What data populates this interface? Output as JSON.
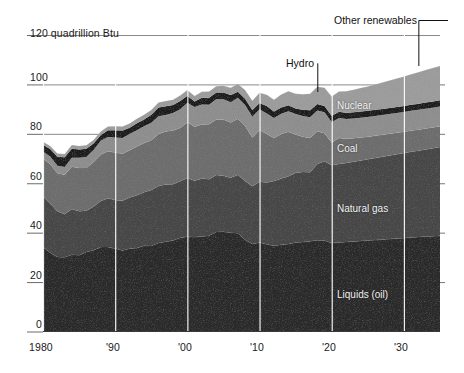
{
  "chart_data": {
    "type": "area",
    "title": "",
    "subtitle": "",
    "unit_label": "120 quadrillion Btu",
    "xlabel": "",
    "ylabel": "quadrillion Btu",
    "ylim": [
      0,
      120
    ],
    "xlim": [
      1980,
      2035
    ],
    "grid": "vertical white decade gridlines plus horizontal tick lines at 0,20,40,60,80,100,120",
    "legend_position": "inline labels on bands with leader lines for Hydro and Other renewables",
    "stacked": true,
    "y_ticks": [
      "0",
      "20",
      "40",
      "60",
      "80",
      "100",
      "120 quadrillion Btu"
    ],
    "y_tick_values": [
      0,
      20,
      40,
      60,
      80,
      100,
      120
    ],
    "x_ticks": [
      "1980",
      "'90",
      "'00",
      "'10",
      "'20",
      "'30"
    ],
    "x_tick_values": [
      1980,
      1990,
      2000,
      2010,
      2020,
      2030
    ],
    "x": [
      1980,
      1981,
      1982,
      1983,
      1984,
      1985,
      1986,
      1987,
      1988,
      1989,
      1990,
      1991,
      1992,
      1993,
      1994,
      1995,
      1996,
      1997,
      1998,
      1999,
      2000,
      2001,
      2002,
      2003,
      2004,
      2005,
      2006,
      2007,
      2008,
      2009,
      2010,
      2011,
      2012,
      2013,
      2014,
      2015,
      2016,
      2017,
      2018,
      2019,
      2020,
      2021,
      2022,
      2023,
      2024,
      2025,
      2026,
      2027,
      2028,
      2029,
      2030,
      2031,
      2032,
      2033,
      2034,
      2035
    ],
    "series": [
      {
        "name": "Liquids (oil)",
        "color": "#2b2b2b",
        "label_x": 2020,
        "values": [
          34.2,
          31.9,
          30.2,
          30.1,
          31.1,
          30.9,
          32.2,
          32.9,
          34.2,
          34.2,
          33.6,
          32.8,
          33.5,
          33.8,
          34.7,
          34.6,
          35.8,
          36.3,
          36.8,
          37.9,
          38.3,
          38.2,
          38.4,
          38.8,
          40.3,
          40.4,
          40.0,
          39.8,
          37.1,
          35.4,
          36.0,
          35.3,
          34.7,
          35.1,
          35.4,
          36.0,
          36.2,
          36.5,
          36.9,
          36.8,
          35.8,
          36.0,
          36.2,
          36.4,
          36.6,
          36.8,
          37.0,
          37.2,
          37.4,
          37.6,
          37.8,
          38.0,
          38.2,
          38.4,
          38.6,
          38.8
        ]
      },
      {
        "name": "Natural gas",
        "color": "#474747",
        "label_x": 2020,
        "values": [
          20.4,
          19.9,
          18.5,
          17.4,
          18.5,
          17.8,
          16.7,
          17.7,
          18.6,
          19.7,
          19.6,
          20.1,
          20.7,
          21.3,
          21.7,
          22.7,
          23.1,
          23.2,
          22.8,
          22.9,
          23.8,
          22.8,
          23.5,
          22.8,
          23.0,
          22.6,
          22.2,
          23.6,
          23.8,
          23.4,
          24.6,
          25.0,
          26.2,
          26.8,
          27.4,
          28.2,
          28.4,
          28.0,
          30.9,
          32.1,
          31.5,
          31.8,
          32.0,
          32.3,
          32.6,
          32.9,
          33.2,
          33.5,
          33.8,
          34.1,
          34.4,
          34.7,
          35.0,
          35.3,
          35.6,
          35.9
        ]
      },
      {
        "name": "Coal",
        "color": "#6d6d6d",
        "label_x": 2020,
        "values": [
          15.4,
          16.0,
          15.3,
          15.9,
          17.1,
          17.5,
          17.3,
          18.0,
          18.8,
          19.1,
          19.2,
          19.0,
          19.2,
          19.8,
          19.9,
          20.1,
          21.0,
          21.4,
          21.7,
          21.6,
          22.6,
          21.9,
          21.9,
          22.3,
          22.5,
          22.8,
          22.4,
          22.7,
          22.4,
          19.7,
          21.0,
          19.6,
          17.4,
          18.0,
          18.0,
          15.5,
          14.2,
          13.8,
          13.2,
          11.3,
          9.2,
          10.5,
          9.8,
          9.5,
          9.3,
          9.1,
          9.0,
          8.9,
          8.8,
          8.7,
          8.6,
          8.6,
          8.5,
          8.5,
          8.4,
          8.4
        ]
      },
      {
        "name": "Nuclear",
        "color": "#8e8e8e",
        "label_x": 2020,
        "values": [
          2.7,
          3.0,
          3.1,
          3.2,
          3.6,
          4.1,
          4.4,
          4.9,
          5.6,
          5.7,
          6.1,
          6.4,
          6.5,
          6.5,
          6.8,
          7.1,
          7.2,
          6.7,
          7.1,
          7.6,
          7.9,
          8.0,
          8.1,
          7.9,
          8.2,
          8.2,
          8.2,
          8.5,
          8.4,
          8.4,
          8.4,
          8.3,
          8.1,
          8.2,
          8.3,
          8.3,
          8.4,
          8.4,
          8.4,
          8.5,
          8.2,
          8.1,
          8.0,
          8.0,
          8.0,
          8.0,
          8.0,
          8.0,
          8.0,
          8.0,
          8.0,
          8.0,
          8.0,
          8.0,
          8.0,
          8.0
        ]
      },
      {
        "name": "Hydro",
        "color": "#1c1c1c",
        "label_x": 2018,
        "values": [
          2.9,
          3.1,
          3.6,
          3.9,
          3.8,
          3.4,
          3.4,
          2.6,
          2.3,
          2.8,
          3.0,
          3.0,
          2.6,
          2.9,
          2.7,
          3.2,
          3.6,
          3.6,
          3.3,
          3.3,
          2.8,
          2.2,
          2.7,
          2.8,
          2.7,
          2.7,
          2.9,
          2.4,
          2.5,
          2.7,
          2.5,
          3.1,
          2.6,
          2.6,
          2.5,
          2.3,
          2.5,
          2.8,
          2.7,
          2.6,
          2.6,
          2.5,
          2.5,
          2.5,
          2.5,
          2.5,
          2.5,
          2.5,
          2.5,
          2.5,
          2.5,
          2.5,
          2.5,
          2.5,
          2.5,
          2.5
        ]
      },
      {
        "name": "Other renewables",
        "color": "#9c9c9c",
        "label_x": 2032,
        "values": [
          1.2,
          1.2,
          1.3,
          1.3,
          1.4,
          1.4,
          1.4,
          1.4,
          1.4,
          1.5,
          1.6,
          1.7,
          1.7,
          1.8,
          1.9,
          1.9,
          2.0,
          2.1,
          2.1,
          2.2,
          2.3,
          2.2,
          2.4,
          2.5,
          2.6,
          2.8,
          3.0,
          3.2,
          3.5,
          3.8,
          4.1,
          4.5,
          4.8,
          5.2,
          5.6,
          5.9,
          6.3,
          6.7,
          7.0,
          7.4,
          7.8,
          8.2,
          8.7,
          9.1,
          9.5,
          9.9,
          10.3,
          10.7,
          11.1,
          11.5,
          11.9,
          12.3,
          12.7,
          13.1,
          13.5,
          13.9
        ]
      }
    ],
    "annotations": [
      {
        "name": "hydro-callout",
        "text": "Hydro",
        "leader_x": 2018
      },
      {
        "name": "other-renewables-callout",
        "text": "Other renewables",
        "leader_x": 2032
      }
    ]
  },
  "labels": {
    "top_unit": "120 quadrillion Btu",
    "y_100": "100",
    "y_80": "80",
    "y_60": "60",
    "y_40": "40",
    "y_20": "20",
    "y_0": "0",
    "x_1980": "1980",
    "x_90": "'90",
    "x_00": "'00",
    "x_10": "'10",
    "x_20": "'20",
    "x_30": "'30",
    "band_other_renewables": "Other renewables",
    "band_hydro": "Hydro",
    "band_nuclear": "Nuclear",
    "band_coal": "Coal",
    "band_natural_gas": "Natural gas",
    "band_liquids": "Liquids (oil)"
  },
  "colors": {
    "background": "#ffffff",
    "axis_text": "#1a1a1a",
    "gridline": "#ffffff",
    "tickline": "#6b6b6b",
    "liquids": "#2b2b2b",
    "natural_gas": "#474747",
    "coal": "#6d6d6d",
    "nuclear": "#8e8e8e",
    "hydro": "#1c1c1c",
    "other_renewables": "#9c9c9c"
  }
}
